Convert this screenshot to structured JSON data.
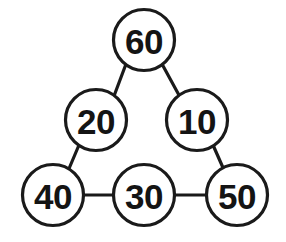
{
  "diagram": {
    "type": "node-link-graph",
    "title": "",
    "background_color": "#ffffff",
    "stroke_color": "#1a1a1a",
    "node_fill_color": "#ffffff",
    "label_color": "#141414",
    "node_radius": 30.5,
    "stroke_width": 3.2,
    "nodes": [
      {
        "id": "n60",
        "label": "60",
        "cx": 144,
        "cy": 40,
        "name": "node-60"
      },
      {
        "id": "n20",
        "label": "20",
        "cx": 96,
        "cy": 120,
        "name": "node-20"
      },
      {
        "id": "n10",
        "label": "10",
        "cx": 197,
        "cy": 120,
        "name": "node-10"
      },
      {
        "id": "n40",
        "label": "40",
        "cx": 53,
        "cy": 195,
        "name": "node-40"
      },
      {
        "id": "n30",
        "label": "30",
        "cx": 144,
        "cy": 195,
        "name": "node-30"
      },
      {
        "id": "n50",
        "label": "50",
        "cx": 237,
        "cy": 195,
        "name": "node-50"
      }
    ],
    "edges": [
      {
        "id": "e1",
        "from": "n60",
        "to": "n20",
        "x1": 126,
        "y1": 64,
        "x2": 114,
        "y2": 96,
        "name": "edge-60-20"
      },
      {
        "id": "e2",
        "from": "n60",
        "to": "n10",
        "x1": 162,
        "y1": 64,
        "x2": 180,
        "y2": 97,
        "name": "edge-60-10"
      },
      {
        "id": "e3",
        "from": "n20",
        "to": "n40",
        "x1": 79,
        "y1": 145,
        "x2": 68,
        "y2": 171,
        "name": "edge-20-40"
      },
      {
        "id": "e4",
        "from": "n10",
        "to": "n50",
        "x1": 213,
        "y1": 145,
        "x2": 224,
        "y2": 170,
        "name": "edge-10-50"
      },
      {
        "id": "e5",
        "from": "n40",
        "to": "n30",
        "x1": 84,
        "y1": 195,
        "x2": 113,
        "y2": 195,
        "name": "edge-40-30"
      },
      {
        "id": "e6",
        "from": "n30",
        "to": "n50",
        "x1": 175,
        "y1": 195,
        "x2": 206,
        "y2": 195,
        "name": "edge-30-50"
      }
    ]
  }
}
